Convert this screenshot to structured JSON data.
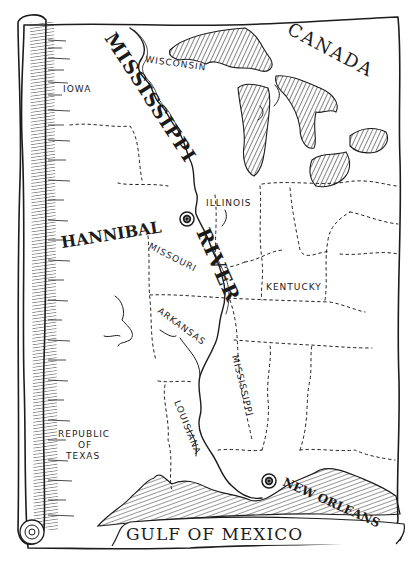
{
  "map": {
    "style": "hand-drawn parchment scroll",
    "ink_color": "#1c1c1c",
    "paper_color": "#ffffff",
    "river": {
      "label_upper": "MISSISSIPPI",
      "label_lower": "RIVER"
    },
    "regions": {
      "canada": "CANADA",
      "wisconsin": "WISCONSIN",
      "iowa": "IOWA",
      "illinois": "ILLINOIS",
      "missouri": "MISSOURI",
      "kentucky": "KENTUCKY",
      "arkansas": "ARKANSAS",
      "mississippi_state": "MISSISSIPPI",
      "louisiana": "LOUISIANA",
      "texas_line1": "REPUBLIC",
      "texas_line2": "OF",
      "texas_line3": "TEXAS",
      "gulf": "GULF OF MEXICO"
    },
    "cities": [
      {
        "name": "HANNIBAL",
        "marker": "circle-city-marker"
      },
      {
        "name": "NEW ORLEANS",
        "marker": "circle-city-marker"
      }
    ],
    "features": [
      "Great Lakes (hatched)",
      "rolled scroll edge (left)",
      "Gulf coastline (hatched)"
    ]
  }
}
